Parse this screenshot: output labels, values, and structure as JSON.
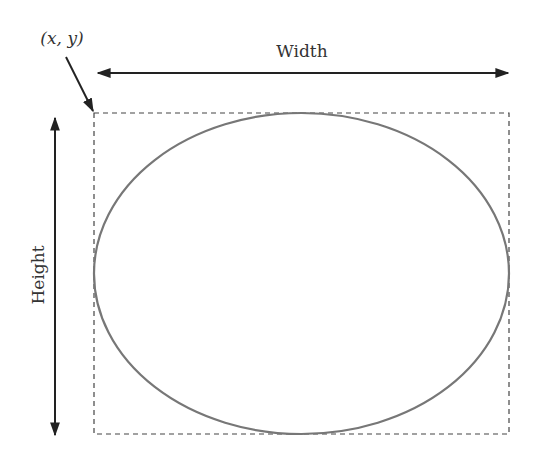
{
  "diagram": {
    "type": "ellipse-bounding-box",
    "labels": {
      "origin": "(x, y)",
      "width": "Width",
      "height": "Height"
    },
    "colors": {
      "background": "#ffffff",
      "ellipse_stroke": "#777777",
      "box_stroke": "#444444",
      "arrow": "#222222",
      "text": "#333333"
    },
    "bounding_box": {
      "x": 94,
      "y": 113,
      "width": 415,
      "height": 321,
      "style": "dashed"
    },
    "ellipse": {
      "cx": 301.5,
      "cy": 273.5,
      "rx": 207.5,
      "ry": 160.5
    }
  }
}
